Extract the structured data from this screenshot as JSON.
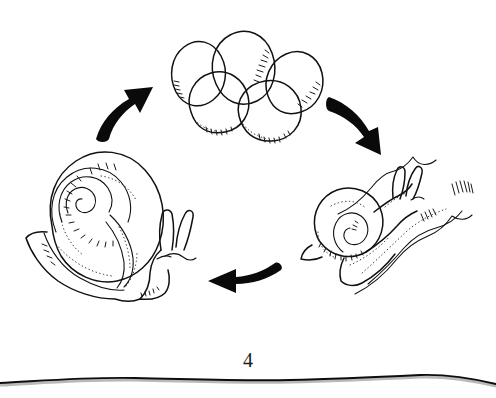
{
  "figure": {
    "number": "4",
    "caption_text": "4",
    "background_color": "#ffffff",
    "ink_color": "#111111",
    "arrow_color": "#0a0a0a",
    "scan_edge_color": "#0d0d0d",
    "scan_shadow_color": "#b9b9b9"
  },
  "diagram": {
    "type": "cycle",
    "stages": [
      {
        "id": "eggs",
        "label": "eggs",
        "description": "Cluster of five snail eggs",
        "egg_count": "5",
        "position": "top-center"
      },
      {
        "id": "juvenile-snail",
        "label": "juvenile snail",
        "description": "Young snail crawling on a leaf",
        "position": "right"
      },
      {
        "id": "adult-snail",
        "label": "adult snail",
        "description": "Adult snail with large coiled shell and tentacles",
        "position": "left"
      }
    ],
    "arrows": [
      {
        "id": "arrow-eggs-to-juvenile",
        "from": "eggs",
        "to": "juvenile-snail",
        "direction": "down-right",
        "position": "top-right"
      },
      {
        "id": "arrow-juvenile-to-adult",
        "from": "juvenile-snail",
        "to": "adult-snail",
        "direction": "left",
        "position": "bottom-center"
      },
      {
        "id": "arrow-adult-to-eggs",
        "from": "adult-snail",
        "to": "eggs",
        "direction": "up-right",
        "position": "top-left"
      }
    ]
  }
}
